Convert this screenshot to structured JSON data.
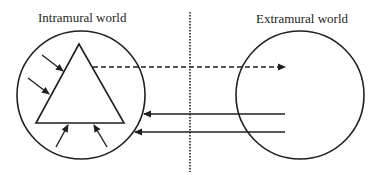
{
  "diagram": {
    "labels": {
      "intramural": "Intramural world",
      "extramural": "Extramural world"
    },
    "colors": {
      "stroke": "#231f20",
      "background": "#ffffff"
    },
    "shapes": {
      "intramural_circle": {
        "cx": 81,
        "cy": 95,
        "r": 64
      },
      "extramural_circle": {
        "cx": 300,
        "cy": 95,
        "r": 64
      },
      "triangle": {
        "points": [
          [
            79,
            44
          ],
          [
            36,
            123
          ],
          [
            124,
            123
          ]
        ]
      },
      "divider": {
        "x": 190,
        "y1": 12,
        "y2": 172,
        "style": "dotted"
      }
    },
    "arrows": [
      {
        "id": "outgoing-dashed",
        "from": [
          93,
          67
        ],
        "to": [
          285,
          67
        ],
        "style": "dashed"
      },
      {
        "id": "incoming-1",
        "from": [
          285,
          114
        ],
        "to": [
          143,
          114
        ],
        "style": "solid"
      },
      {
        "id": "incoming-2",
        "from": [
          285,
          132
        ],
        "to": [
          135,
          132
        ],
        "style": "solid"
      },
      {
        "id": "inner-left-upper",
        "from": [
          42,
          55
        ],
        "to": [
          62,
          70
        ],
        "style": "solid"
      },
      {
        "id": "inner-left-lower",
        "from": [
          27,
          77
        ],
        "to": [
          48,
          92
        ],
        "style": "solid"
      },
      {
        "id": "inner-bottom-left",
        "from": [
          56,
          146
        ],
        "to": [
          67,
          125
        ],
        "style": "solid"
      },
      {
        "id": "inner-bottom-right",
        "from": [
          107,
          146
        ],
        "to": [
          94,
          125
        ],
        "style": "solid"
      }
    ]
  }
}
